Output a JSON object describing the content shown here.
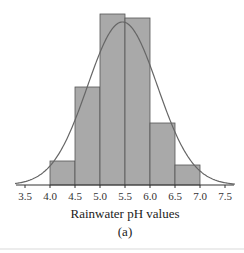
{
  "chart_data": {
    "type": "bar",
    "subtype": "histogram_with_normal_curve",
    "title": "",
    "xlabel": "Rainwater pH values",
    "ylabel": "",
    "panel_label": "(a)",
    "x_ticks": [
      "3.5",
      "4.0",
      "4.5",
      "5.0",
      "5.5",
      "6.0",
      "6.5",
      "7.0",
      "7.5"
    ],
    "xlim": [
      3.5,
      7.5
    ],
    "bins": [
      {
        "from": 4.0,
        "to": 4.5
      },
      {
        "from": 4.5,
        "to": 5.0
      },
      {
        "from": 5.0,
        "to": 5.5
      },
      {
        "from": 5.5,
        "to": 6.0
      },
      {
        "from": 6.0,
        "to": 6.5
      },
      {
        "from": 6.5,
        "to": 7.0
      }
    ],
    "categories": [
      "4.0-4.5",
      "4.5-5.0",
      "5.0-5.5",
      "5.5-6.0",
      "6.0-6.5",
      "6.5-7.0"
    ],
    "values": [
      24,
      98,
      171,
      167,
      62,
      20
    ],
    "value_units": "relative height (no y-axis shown)",
    "normal_curve": {
      "mean": 5.45,
      "sd": 0.7,
      "peak": 163
    },
    "grid": false,
    "legend": null,
    "colors": {
      "bar_fill": "#a9a9a9",
      "bar_edge": "#555555",
      "curve": "#666666",
      "axis": "#333333"
    }
  }
}
